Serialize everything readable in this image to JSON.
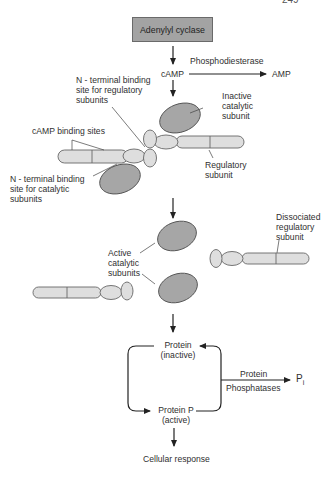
{
  "page_number": "249",
  "top": {
    "enzyme_box": "Adenylyl cyclase",
    "camp": "cAMP",
    "phosphodiesterase": "Phosphodiesterase",
    "amp": "AMP"
  },
  "holoenzyme_labels": {
    "n_terminal_regulatory": [
      "N - terminal binding",
      "site for regulatory",
      "subunits"
    ],
    "camp_binding_sites": "cAMP binding sites",
    "n_terminal_catalytic": [
      "N - terminal binding",
      "site for catalytic",
      "subunits"
    ],
    "inactive_catalytic": [
      "Inactive",
      "catalytic",
      "subunit"
    ],
    "regulatory_subunit": [
      "Regulatory",
      "subunit"
    ]
  },
  "dissociated_labels": {
    "active_catalytic": [
      "Active",
      "catalytic",
      "subunits"
    ],
    "dissociated_regulatory": [
      "Dissociated",
      "regulatory",
      "subunit"
    ]
  },
  "cycle": {
    "protein_inactive": [
      "Protein",
      "(inactive)"
    ],
    "protein_p_active": [
      "Protein P",
      "(active)"
    ],
    "phosphatase_top": "Protein",
    "phosphatase_bottom": "Phosphatases",
    "pi": "P",
    "pi_sub": "i",
    "cellular_response": "Cellular response"
  },
  "colors": {
    "catalytic_fill": "#a6a6a6",
    "regulatory_fill": "#dedede",
    "box_fill": "#a3a3a3",
    "stroke": "#555555"
  }
}
